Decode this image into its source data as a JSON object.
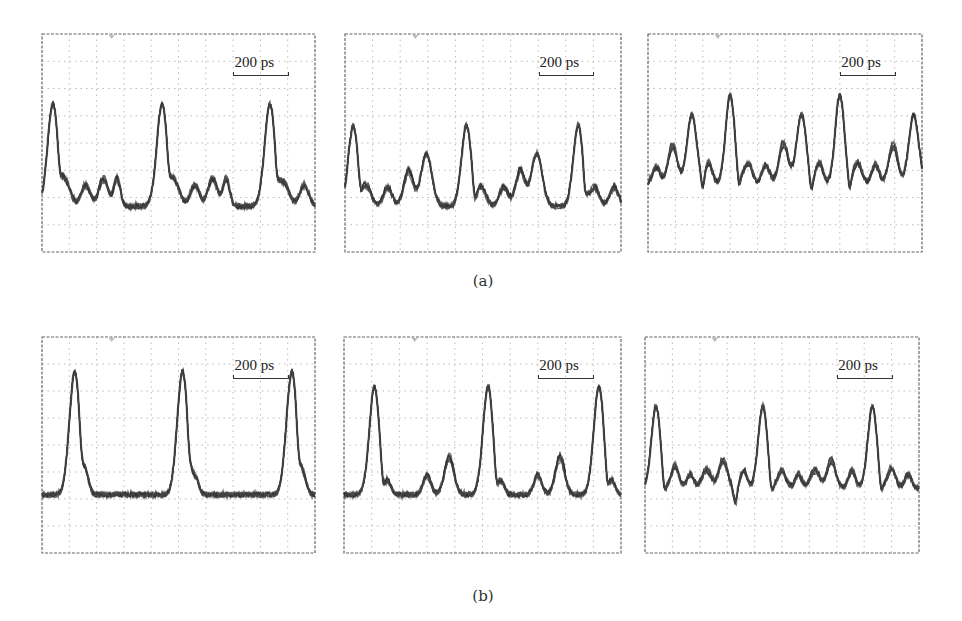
{
  "figure": {
    "captions": {
      "a": "(a)",
      "b": "(b)"
    },
    "scale_bar_label": "200 ps"
  },
  "chart_data": [
    {
      "type": "line",
      "id": "a1",
      "row": "a",
      "title": "",
      "scale_bar": "200 ps",
      "grid": {
        "divisions_x": 10,
        "divisions_y": 8,
        "on": true
      },
      "baseline": 0.79,
      "description": "Oscilloscope eye/pulse trace: three tall pulses with four small trailing bumps each",
      "pulses": [
        {
          "x": 0.04,
          "height": 0.47,
          "width": 0.035
        },
        {
          "x": 0.44,
          "height": 0.47,
          "width": 0.035
        },
        {
          "x": 0.835,
          "height": 0.47,
          "width": 0.035
        },
        {
          "x": 0.09,
          "height": 0.1,
          "width": 0.03
        },
        {
          "x": 0.16,
          "height": 0.1,
          "width": 0.03
        },
        {
          "x": 0.225,
          "height": 0.13,
          "width": 0.03
        },
        {
          "x": 0.275,
          "height": 0.13,
          "width": 0.022
        },
        {
          "x": 0.49,
          "height": 0.1,
          "width": 0.03
        },
        {
          "x": 0.56,
          "height": 0.1,
          "width": 0.03
        },
        {
          "x": 0.625,
          "height": 0.13,
          "width": 0.03
        },
        {
          "x": 0.675,
          "height": 0.13,
          "width": 0.022
        },
        {
          "x": 0.89,
          "height": 0.1,
          "width": 0.03
        },
        {
          "x": 0.96,
          "height": 0.1,
          "width": 0.03
        }
      ],
      "dips": [
        0.065,
        0.465,
        0.86
      ]
    },
    {
      "type": "line",
      "id": "a2",
      "row": "a",
      "scale_bar": "200 ps",
      "grid": {
        "divisions_x": 10,
        "divisions_y": 8,
        "on": true
      },
      "baseline": 0.79,
      "pulses": [
        {
          "x": 0.03,
          "height": 0.37,
          "width": 0.032
        },
        {
          "x": 0.44,
          "height": 0.37,
          "width": 0.032
        },
        {
          "x": 0.845,
          "height": 0.37,
          "width": 0.032
        },
        {
          "x": 0.08,
          "height": 0.09,
          "width": 0.028
        },
        {
          "x": 0.155,
          "height": 0.09,
          "width": 0.028
        },
        {
          "x": 0.23,
          "height": 0.17,
          "width": 0.03
        },
        {
          "x": 0.295,
          "height": 0.24,
          "width": 0.035
        },
        {
          "x": 0.495,
          "height": 0.09,
          "width": 0.028
        },
        {
          "x": 0.575,
          "height": 0.09,
          "width": 0.028
        },
        {
          "x": 0.635,
          "height": 0.17,
          "width": 0.03
        },
        {
          "x": 0.695,
          "height": 0.24,
          "width": 0.035
        },
        {
          "x": 0.905,
          "height": 0.09,
          "width": 0.028
        },
        {
          "x": 0.975,
          "height": 0.09,
          "width": 0.028
        }
      ],
      "dips": [
        0.055,
        0.47,
        0.87
      ]
    },
    {
      "type": "line",
      "id": "a3",
      "row": "a",
      "scale_bar": "200 ps",
      "grid": {
        "divisions_x": 10,
        "divisions_y": 8,
        "on": true
      },
      "baseline": 0.69,
      "pulses": [
        {
          "x": 0.03,
          "height": 0.08,
          "width": 0.025
        },
        {
          "x": 0.09,
          "height": 0.18,
          "width": 0.03
        },
        {
          "x": 0.16,
          "height": 0.32,
          "width": 0.032
        },
        {
          "x": 0.22,
          "height": 0.1,
          "width": 0.025
        },
        {
          "x": 0.3,
          "height": 0.41,
          "width": 0.03
        },
        {
          "x": 0.365,
          "height": 0.1,
          "width": 0.028
        },
        {
          "x": 0.43,
          "height": 0.09,
          "width": 0.025
        },
        {
          "x": 0.495,
          "height": 0.19,
          "width": 0.03
        },
        {
          "x": 0.56,
          "height": 0.32,
          "width": 0.032
        },
        {
          "x": 0.625,
          "height": 0.1,
          "width": 0.025
        },
        {
          "x": 0.7,
          "height": 0.41,
          "width": 0.03
        },
        {
          "x": 0.765,
          "height": 0.1,
          "width": 0.028
        },
        {
          "x": 0.83,
          "height": 0.09,
          "width": 0.025
        },
        {
          "x": 0.895,
          "height": 0.18,
          "width": 0.03
        },
        {
          "x": 0.97,
          "height": 0.32,
          "width": 0.032
        }
      ],
      "dips": [
        0.2,
        0.33,
        0.595,
        0.735
      ]
    },
    {
      "type": "line",
      "id": "b1",
      "row": "b",
      "scale_bar": "200 ps",
      "grid": {
        "divisions_x": 10,
        "divisions_y": 8,
        "on": true
      },
      "baseline": 0.73,
      "pulses": [
        {
          "x": 0.12,
          "height": 0.57,
          "width": 0.035
        },
        {
          "x": 0.515,
          "height": 0.57,
          "width": 0.035
        },
        {
          "x": 0.915,
          "height": 0.57,
          "width": 0.035
        },
        {
          "x": 0.165,
          "height": 0.06,
          "width": 0.02
        },
        {
          "x": 0.565,
          "height": 0.06,
          "width": 0.02
        },
        {
          "x": 0.96,
          "height": 0.06,
          "width": 0.02
        }
      ],
      "dips": [
        0.145,
        0.54,
        0.94
      ]
    },
    {
      "type": "line",
      "id": "b2",
      "row": "b",
      "scale_bar": "200 ps",
      "grid": {
        "divisions_x": 10,
        "divisions_y": 8,
        "on": true
      },
      "baseline": 0.73,
      "pulses": [
        {
          "x": 0.11,
          "height": 0.5,
          "width": 0.033
        },
        {
          "x": 0.52,
          "height": 0.5,
          "width": 0.033
        },
        {
          "x": 0.92,
          "height": 0.5,
          "width": 0.033
        },
        {
          "x": 0.16,
          "height": 0.05,
          "width": 0.02
        },
        {
          "x": 0.3,
          "height": 0.09,
          "width": 0.025
        },
        {
          "x": 0.38,
          "height": 0.17,
          "width": 0.03
        },
        {
          "x": 0.57,
          "height": 0.05,
          "width": 0.02
        },
        {
          "x": 0.7,
          "height": 0.09,
          "width": 0.025
        },
        {
          "x": 0.78,
          "height": 0.17,
          "width": 0.03
        },
        {
          "x": 0.97,
          "height": 0.05,
          "width": 0.02
        }
      ],
      "dips": [
        0.14,
        0.55,
        0.95
      ]
    },
    {
      "type": "line",
      "id": "b3",
      "row": "b",
      "scale_bar": "200 ps",
      "grid": {
        "divisions_x": 10,
        "divisions_y": 8,
        "on": true
      },
      "baseline": 0.7,
      "pulses": [
        {
          "x": 0.04,
          "height": 0.38,
          "width": 0.03
        },
        {
          "x": 0.43,
          "height": 0.38,
          "width": 0.03
        },
        {
          "x": 0.83,
          "height": 0.38,
          "width": 0.03
        },
        {
          "x": 0.11,
          "height": 0.11,
          "width": 0.025
        },
        {
          "x": 0.165,
          "height": 0.07,
          "width": 0.022
        },
        {
          "x": 0.225,
          "height": 0.09,
          "width": 0.03
        },
        {
          "x": 0.285,
          "height": 0.14,
          "width": 0.028
        },
        {
          "x": 0.36,
          "height": 0.09,
          "width": 0.022
        },
        {
          "x": 0.5,
          "height": 0.09,
          "width": 0.025
        },
        {
          "x": 0.56,
          "height": 0.07,
          "width": 0.022
        },
        {
          "x": 0.62,
          "height": 0.09,
          "width": 0.03
        },
        {
          "x": 0.68,
          "height": 0.14,
          "width": 0.028
        },
        {
          "x": 0.755,
          "height": 0.09,
          "width": 0.022
        },
        {
          "x": 0.9,
          "height": 0.1,
          "width": 0.025
        },
        {
          "x": 0.96,
          "height": 0.07,
          "width": 0.022
        }
      ],
      "dips": [
        0.07,
        0.33,
        0.46,
        0.86
      ]
    }
  ]
}
